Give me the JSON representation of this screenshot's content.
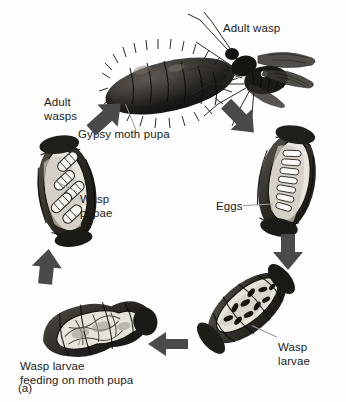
{
  "figure": {
    "caption": "(a)",
    "background_color": "#fefefe",
    "ink_color": "#1a1a1a",
    "arrow_color": "#4a4a4a"
  },
  "labels": {
    "adult_wasp": "Adult wasp",
    "adult_wasps": "Adult\nwasps",
    "gypsy_moth_pupa": "Gypsy moth pupa",
    "wasp_pupae": "Wasp\npupae",
    "eggs": "Eggs",
    "wasp_larvae": "Wasp\nlarvae",
    "wasp_larvae_feeding": "Wasp larvae\nfeeding on moth pupa"
  },
  "stages": [
    {
      "name": "adult-wasp-on-moth-pupa",
      "label": "Adult wasp",
      "secondary_label": "Gypsy moth pupa",
      "position": "top"
    },
    {
      "name": "pupa-with-eggs",
      "label": "Eggs",
      "position": "right"
    },
    {
      "name": "pupa-with-wasp-larvae",
      "label": "Wasp larvae",
      "position": "bottom-right"
    },
    {
      "name": "wasp-larvae-feeding-on-moth-pupa",
      "label": "Wasp larvae feeding on moth pupa",
      "position": "bottom-left"
    },
    {
      "name": "pupa-with-wasp-pupae",
      "label": "Wasp pupae",
      "position": "left"
    }
  ],
  "arrows": [
    {
      "name": "arrow-to-eggs",
      "direction": "down-right",
      "from": "adult-wasp-on-moth-pupa",
      "to": "pupa-with-eggs"
    },
    {
      "name": "arrow-to-larvae",
      "direction": "down",
      "from": "pupa-with-eggs",
      "to": "pupa-with-wasp-larvae"
    },
    {
      "name": "arrow-to-feeding",
      "direction": "left",
      "from": "pupa-with-wasp-larvae",
      "to": "wasp-larvae-feeding-on-moth-pupa"
    },
    {
      "name": "arrow-to-wasp-pupae",
      "direction": "up",
      "from": "wasp-larvae-feeding-on-moth-pupa",
      "to": "pupa-with-wasp-pupae"
    },
    {
      "name": "arrow-to-adult-wasps",
      "direction": "up-right",
      "from": "pupa-with-wasp-pupae",
      "to": "adult-wasp-on-moth-pupa"
    }
  ]
}
